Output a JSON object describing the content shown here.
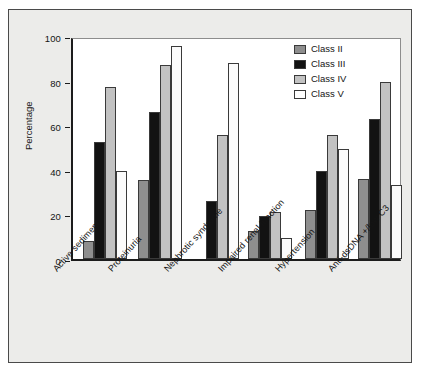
{
  "figure": {
    "background_color": "#ececea",
    "frame_color": "#4a4a4a",
    "plot_background": "#ffffff"
  },
  "chart_data": {
    "type": "bar",
    "title": "",
    "subtitle": "",
    "xlabel": "",
    "ylabel": "Percentage",
    "ylim": [
      0,
      100
    ],
    "yticks": [
      0,
      20,
      40,
      60,
      80,
      100
    ],
    "ytick_labels": [
      "0",
      "20",
      "40",
      "60",
      "80",
      "100"
    ],
    "grid": false,
    "legend_position": "top-right",
    "categories": [
      "Active sediment",
      "Proteinuria",
      "Nephrotic syndrome",
      "Impaired renal function",
      "Hypertension",
      "Anti-dsDNA +/low C3"
    ],
    "series": [
      {
        "name": "Class II",
        "color": "#8e8e8e",
        "values": [
          8,
          35.5,
          0,
          12.5,
          22,
          36
        ]
      },
      {
        "name": "Class III",
        "color": "#121212",
        "values": [
          52.5,
          66,
          26,
          19.5,
          39.5,
          63
        ]
      },
      {
        "name": "Class IV",
        "color": "#c2c2c2",
        "values": [
          77,
          87,
          55.5,
          21,
          55.5,
          79.5
        ]
      },
      {
        "name": "Class V",
        "color": "#fbfbfb",
        "values": [
          39.5,
          95.5,
          88,
          9.5,
          49.5,
          33
        ]
      }
    ]
  },
  "legend": {
    "items": [
      {
        "label": "Class II",
        "swatch": "c2"
      },
      {
        "label": "Class III",
        "swatch": "c3"
      },
      {
        "label": "Class IV",
        "swatch": "c4"
      },
      {
        "label": "Class V",
        "swatch": "c5"
      }
    ]
  }
}
